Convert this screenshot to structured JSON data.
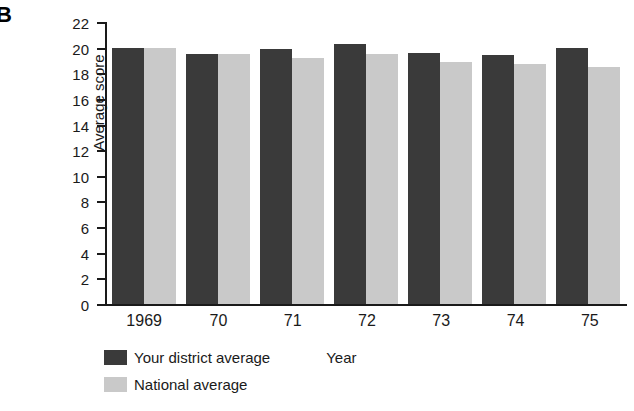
{
  "panel": {
    "letter": "B"
  },
  "chart_data": {
    "type": "bar",
    "title": "",
    "xlabel": "Year",
    "ylabel": "Average score",
    "ylim": [
      0,
      22
    ],
    "ytick_step": 2,
    "yticks": [
      22,
      20,
      18,
      16,
      14,
      12,
      10,
      8,
      6,
      4,
      2,
      0
    ],
    "grid": false,
    "legend_position": "below-left",
    "categories": [
      "1969",
      "70",
      "71",
      "72",
      "73",
      "74",
      "75"
    ],
    "series": [
      {
        "name": "Your district average",
        "color": "#3a3a3a",
        "values": [
          20.0,
          19.5,
          19.9,
          20.3,
          19.6,
          19.4,
          20.0
        ]
      },
      {
        "name": "National average",
        "color": "#c9c9c9",
        "values": [
          20.0,
          19.5,
          19.2,
          19.5,
          18.9,
          18.7,
          18.5
        ]
      }
    ]
  }
}
